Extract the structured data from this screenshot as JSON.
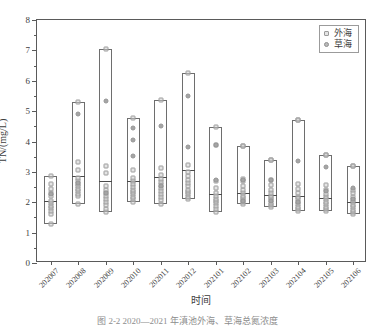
{
  "chart_data": {
    "type": "bar",
    "title": "",
    "xlabel": "时间",
    "ylabel": "TN/(mg/L)",
    "ylim": [
      0,
      8
    ],
    "y_major_ticks": [
      0,
      1,
      2,
      3,
      4,
      5,
      6,
      7,
      8
    ],
    "y_tick_labels": [
      "0",
      "1",
      "2",
      "3",
      "4",
      "5",
      "6",
      "7",
      "8"
    ],
    "y_minor_step": 0.25,
    "grid": false,
    "legend_position": "top-right",
    "legend": [
      {
        "name": "外海",
        "marker": "open-square"
      },
      {
        "name": "草海",
        "marker": "filled-circle"
      }
    ],
    "categories": [
      "202007",
      "202008",
      "202009",
      "202010",
      "202011",
      "202012",
      "202101",
      "202102",
      "202103",
      "202104",
      "202105",
      "202106"
    ],
    "boxes": [
      {
        "category": "202007",
        "min": 1.3,
        "max": 2.85,
        "median": 2.03
      },
      {
        "category": "202008",
        "min": 1.93,
        "max": 5.3,
        "median": 2.87
      },
      {
        "category": "202009",
        "min": 1.67,
        "max": 7.05,
        "median": 2.7
      },
      {
        "category": "202010",
        "min": 2.0,
        "max": 4.78,
        "median": 2.71
      },
      {
        "category": "202011",
        "min": 1.95,
        "max": 5.38,
        "median": 2.83
      },
      {
        "category": "202012",
        "min": 2.1,
        "max": 6.27,
        "median": 3.07
      },
      {
        "category": "202101",
        "min": 1.67,
        "max": 4.49,
        "median": 2.26
      },
      {
        "category": "202102",
        "min": 1.93,
        "max": 3.86,
        "median": 2.3
      },
      {
        "category": "202103",
        "min": 1.84,
        "max": 3.38,
        "median": 2.25
      },
      {
        "category": "202104",
        "min": 1.7,
        "max": 4.7,
        "median": 2.2
      },
      {
        "category": "202105",
        "min": 1.7,
        "max": 3.54,
        "median": 2.15
      },
      {
        "category": "202106",
        "min": 1.6,
        "max": 3.2,
        "median": 2.0
      }
    ],
    "series": [
      {
        "name": "外海",
        "marker": "open-square",
        "points": [
          {
            "category": "202007",
            "values": [
              1.3,
              1.62,
              1.72,
              1.8,
              1.88,
              1.96,
              2.05,
              2.2,
              2.32,
              2.45,
              2.6,
              2.85
            ]
          },
          {
            "category": "202008",
            "values": [
              1.93,
              2.2,
              2.28,
              2.36,
              2.44,
              2.52,
              2.6,
              2.7,
              2.8,
              3.05,
              3.33,
              5.3
            ]
          },
          {
            "category": "202009",
            "values": [
              1.67,
              1.78,
              1.9,
              2.0,
              2.1,
              2.2,
              2.3,
              2.42,
              2.55,
              2.95,
              3.18,
              7.05
            ]
          },
          {
            "category": "202010",
            "values": [
              2.0,
              2.1,
              2.18,
              2.26,
              2.34,
              2.42,
              2.5,
              2.6,
              2.7,
              2.8,
              3.05,
              4.78
            ]
          },
          {
            "category": "202011",
            "values": [
              1.95,
              2.06,
              2.16,
              2.26,
              2.36,
              2.46,
              2.56,
              2.66,
              2.76,
              2.9,
              3.12,
              5.38
            ]
          },
          {
            "category": "202012",
            "values": [
              2.1,
              2.18,
              2.26,
              2.34,
              2.42,
              2.52,
              2.62,
              2.74,
              2.86,
              3.0,
              3.22,
              6.27
            ]
          },
          {
            "category": "202101",
            "values": [
              1.67,
              1.78,
              1.88,
              1.96,
              2.04,
              2.12,
              2.2,
              2.3,
              2.46,
              2.7,
              3.88,
              4.49
            ]
          },
          {
            "category": "202102",
            "values": [
              1.93,
              2.0,
              2.06,
              2.14,
              2.22,
              2.3,
              2.4,
              2.54,
              2.7,
              2.76,
              3.86,
              3.86
            ]
          },
          {
            "category": "202103",
            "values": [
              1.84,
              1.9,
              1.98,
              2.06,
              2.14,
              2.22,
              2.3,
              2.4,
              2.56,
              2.72,
              3.38,
              3.38
            ]
          },
          {
            "category": "202104",
            "values": [
              1.7,
              1.78,
              1.86,
              1.94,
              2.02,
              2.1,
              2.18,
              2.3,
              2.44,
              2.6,
              4.7,
              4.7
            ]
          },
          {
            "category": "202105",
            "values": [
              1.7,
              1.78,
              1.86,
              1.94,
              2.02,
              2.1,
              2.18,
              2.28,
              2.4,
              2.56,
              3.54,
              3.54
            ]
          },
          {
            "category": "202106",
            "values": [
              1.6,
              1.68,
              1.76,
              1.84,
              1.92,
              2.0,
              2.08,
              2.18,
              2.3,
              2.42,
              3.2,
              3.2
            ]
          }
        ]
      },
      {
        "name": "草海",
        "marker": "filled-circle",
        "points": [
          {
            "category": "202007",
            "values": [
              2.28
            ]
          },
          {
            "category": "202008",
            "values": [
              2.62,
              4.92
            ]
          },
          {
            "category": "202009",
            "values": [
              2.3,
              5.32
            ]
          },
          {
            "category": "202010",
            "values": [
              3.52,
              4.05,
              4.45
            ]
          },
          {
            "category": "202011",
            "values": [
              2.52,
              4.52
            ]
          },
          {
            "category": "202012",
            "values": [
              3.82,
              5.5
            ]
          },
          {
            "category": "202101",
            "values": [
              2.72,
              3.88
            ]
          },
          {
            "category": "202102",
            "values": [
              2.04,
              2.74
            ]
          },
          {
            "category": "202103",
            "values": [
              2.05,
              2.72
            ]
          },
          {
            "category": "202104",
            "values": [
              2.0,
              3.36
            ]
          },
          {
            "category": "202105",
            "values": [
              2.36,
              3.15
            ]
          },
          {
            "category": "202106",
            "values": [
              2.1,
              2.48
            ]
          }
        ]
      }
    ]
  },
  "caption": {
    "text": "图 2-2   2020—2021 年滇池外海、草海总氮浓度"
  }
}
